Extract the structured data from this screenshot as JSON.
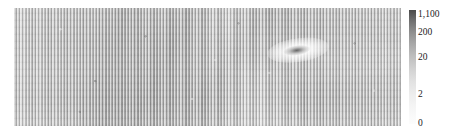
{
  "figure": {
    "type": "heatmap-with-colorbar",
    "background_color": "#ffffff"
  },
  "heatmap": {
    "name": "grayscale-intensity-heatmap",
    "description_alt": "Dense vertically striped grayscale intensity map with diagonal bands and a bright elliptical feature"
  },
  "colorbar": {
    "orientation": "vertical",
    "scale": "logarithmic",
    "low_color": "#fcfcfc",
    "high_color": "#4a4a4a",
    "ticks": [
      {
        "label": "1,100",
        "value": 1100,
        "top_px": 9
      },
      {
        "label": "200",
        "value": 200,
        "top_px": 27
      },
      {
        "label": "20",
        "value": 20,
        "top_px": 52
      },
      {
        "label": "2",
        "value": 2,
        "top_px": 89
      },
      {
        "label": "0",
        "value": 0,
        "top_px": 118
      }
    ]
  },
  "chart_data": {
    "type": "heatmap",
    "title": "",
    "xlabel": "",
    "ylabel": "",
    "colorbar_label": "",
    "colorbar_scale": "log",
    "colorbar_ticks": [
      0,
      2,
      20,
      200,
      1100
    ],
    "colorbar_tick_labels": [
      "0",
      "2",
      "20",
      "200",
      "1,100"
    ],
    "colormap": "grayscale-inverted",
    "vmin": 0,
    "vmax": 1100,
    "grid": false,
    "legend": "none",
    "axis_ticks_visible": false,
    "features": [
      {
        "name": "vertical-striping",
        "period_px": 3,
        "extent": "full-field"
      },
      {
        "name": "diagonal-band-upper-left",
        "orientation_deg": 101
      },
      {
        "name": "diagonal-band-mid",
        "orientation_deg": 116
      },
      {
        "name": "diagonal-band-lower",
        "orientation_deg": 126
      },
      {
        "name": "bright-elliptical-target",
        "x_frac": 0.735,
        "y_frac": 0.36,
        "peak_value": 1100
      }
    ]
  }
}
